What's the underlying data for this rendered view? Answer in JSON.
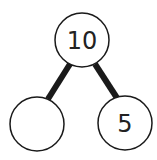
{
  "diagram": {
    "type": "number-bond",
    "whole": {
      "label": "10"
    },
    "parts": [
      {
        "label": ""
      },
      {
        "label": "5"
      }
    ],
    "colors": {
      "stroke": "#1a1a1a",
      "fill": "#ffffff",
      "text": "#222222"
    }
  }
}
